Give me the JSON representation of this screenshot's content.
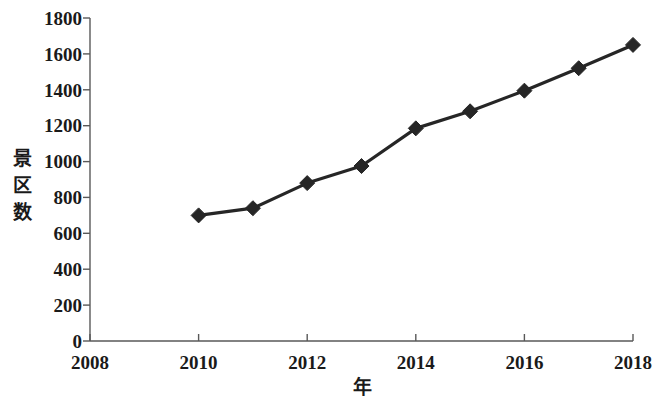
{
  "chart_data": {
    "type": "line",
    "title": "",
    "xlabel": "年",
    "ylabel": "景区数",
    "x": [
      2010,
      2011,
      2012,
      2013,
      2014,
      2015,
      2016,
      2017,
      2018
    ],
    "values": [
      700,
      740,
      880,
      975,
      1185,
      1280,
      1395,
      1520,
      1650
    ],
    "series": [
      {
        "name": "景区数",
        "x": [
          2010,
          2011,
          2012,
          2013,
          2014,
          2015,
          2016,
          2017,
          2018
        ],
        "values": [
          700,
          740,
          880,
          975,
          1185,
          1280,
          1395,
          1520,
          1650
        ],
        "marker": "diamond",
        "color": "#262626"
      }
    ],
    "xlim": [
      2008,
      2018
    ],
    "ylim": [
      0,
      1800
    ],
    "xticks": [
      2008,
      2010,
      2012,
      2014,
      2016,
      2018
    ],
    "xtick_labels": [
      "2008",
      "2010",
      "2012",
      "2014",
      "2016",
      "2018"
    ],
    "yticks": [
      0,
      200,
      400,
      600,
      800,
      1000,
      1200,
      1400,
      1600,
      1800
    ],
    "ytick_labels": [
      "0",
      "200",
      "400",
      "600",
      "800",
      "1000",
      "1200",
      "1400",
      "1600",
      "1800"
    ],
    "grid": false,
    "legend": null,
    "legend_position": "none",
    "ylabel_chars": [
      "景",
      "区",
      "数"
    ],
    "colors": {
      "line": "#262626",
      "marker": "#262626",
      "axis": "#595959",
      "text": "#1a1a1a",
      "background": "#ffffff"
    }
  }
}
